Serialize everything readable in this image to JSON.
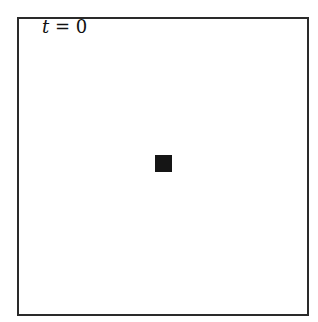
{
  "figure": {
    "label": {
      "variable": "t",
      "operator": " = ",
      "value": "0"
    },
    "cell": {
      "color": "#151515",
      "shape": "filled-square"
    },
    "frame": {
      "border_color": "#2a2a2a"
    }
  }
}
